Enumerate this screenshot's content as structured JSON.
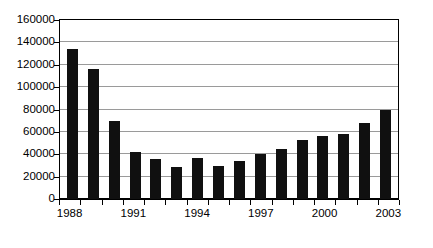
{
  "chart_data": {
    "type": "bar",
    "title": "",
    "subtitle": "",
    "xlabel": "",
    "ylabel": "",
    "categories": [
      "1988",
      "1989",
      "1990",
      "1991",
      "1992",
      "1993",
      "1994",
      "1995",
      "1996",
      "1997",
      "1998",
      "1999",
      "2000",
      "2001",
      "2002",
      "2003"
    ],
    "values": [
      134000,
      116000,
      70000,
      42000,
      36000,
      28500,
      37000,
      29500,
      34000,
      40500,
      44500,
      52500,
      56500,
      58000,
      68000,
      79500
    ],
    "series": [
      {
        "name": "",
        "values": [
          134000,
          116000,
          70000,
          42000,
          36000,
          28500,
          37000,
          29500,
          34000,
          40500,
          44500,
          52500,
          56500,
          58000,
          68000,
          79500
        ]
      }
    ],
    "ylim": [
      0,
      160000
    ],
    "xlim_categories": [
      "1988",
      "2003"
    ],
    "y_ticks": [
      0,
      20000,
      40000,
      60000,
      80000,
      100000,
      120000,
      140000,
      160000
    ],
    "y_tick_labels": [
      "0",
      "20000",
      "40000",
      "60000",
      "80000",
      "100000",
      "120000",
      "140000",
      "160000"
    ],
    "x_tick_labels_shown": [
      "1988",
      "1991",
      "1994",
      "1997",
      "2000",
      "2003"
    ],
    "x_tick_label_indices": [
      0,
      3,
      6,
      9,
      12,
      15
    ],
    "grid": true,
    "grid_axis": "y",
    "legend": false,
    "legend_position": "none",
    "bar_color": "#101010",
    "grid_color": "#9a9a9a",
    "axis_color": "#000000",
    "background_color": "#ffffff"
  }
}
